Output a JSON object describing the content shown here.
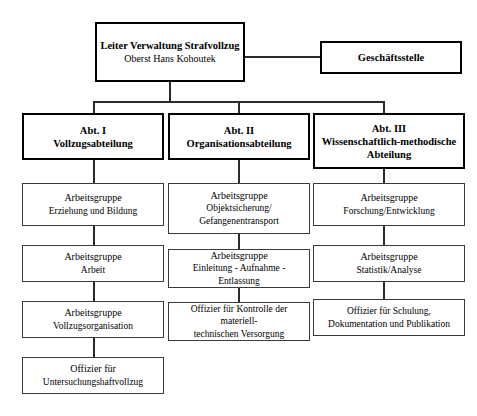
{
  "diagram": {
    "root": {
      "title": "Leiter Verwaltung Strafvollzug",
      "subtitle": "Oberst Hans Kohoutek"
    },
    "staff": {
      "title": "Geschäftsstelle"
    },
    "departments": [
      {
        "id": "abt-1",
        "label_line1": "Abt. I",
        "label_line2": "Vollzugsabteilung",
        "label_line3": "",
        "children": [
          {
            "line1": "Arbeitsgruppe",
            "line2": "Erziehung und Bildung",
            "line3": ""
          },
          {
            "line1": "Arbeitsgruppe",
            "line2": "Arbeit",
            "line3": ""
          },
          {
            "line1": "Arbeitsgruppe",
            "line2": "Vollzugsorganisation",
            "line3": ""
          },
          {
            "line1": "Offizier für",
            "line2": "Untersuchungshaftvollzug",
            "line3": ""
          }
        ]
      },
      {
        "id": "abt-2",
        "label_line1": "Abt. II",
        "label_line2": "Organisationsabteilung",
        "label_line3": "",
        "children": [
          {
            "line1": "Arbeitsgruppe",
            "line2": "Objektsicherung/",
            "line3": "Gefangenentransport"
          },
          {
            "line1": "Arbeitsgruppe",
            "line2": "Einleitung - Aufnahme - Entlassung",
            "line3": ""
          },
          {
            "line1": "Offizier für Kontrolle der materiell-",
            "line2": "technischen Versorgung",
            "line3": ""
          }
        ]
      },
      {
        "id": "abt-3",
        "label_line1": "Abt. III",
        "label_line2": "Wissenschaftlich-methodische",
        "label_line3": "Abteilung",
        "children": [
          {
            "line1": "Arbeitsgruppe",
            "line2": "Forschung/Entwicklung",
            "line3": ""
          },
          {
            "line1": "Arbeitsgruppe",
            "line2": "Statistik/Analyse",
            "line3": ""
          },
          {
            "line1": "Offizier für Schulung,",
            "line2": "Dokumentation und Publikation",
            "line3": ""
          }
        ]
      }
    ],
    "colors": {
      "background": "#ffffff",
      "text": "#000000",
      "major_border": "#000000",
      "leaf_border": "#3a3a3a",
      "connector": "#2b2b2b"
    }
  }
}
